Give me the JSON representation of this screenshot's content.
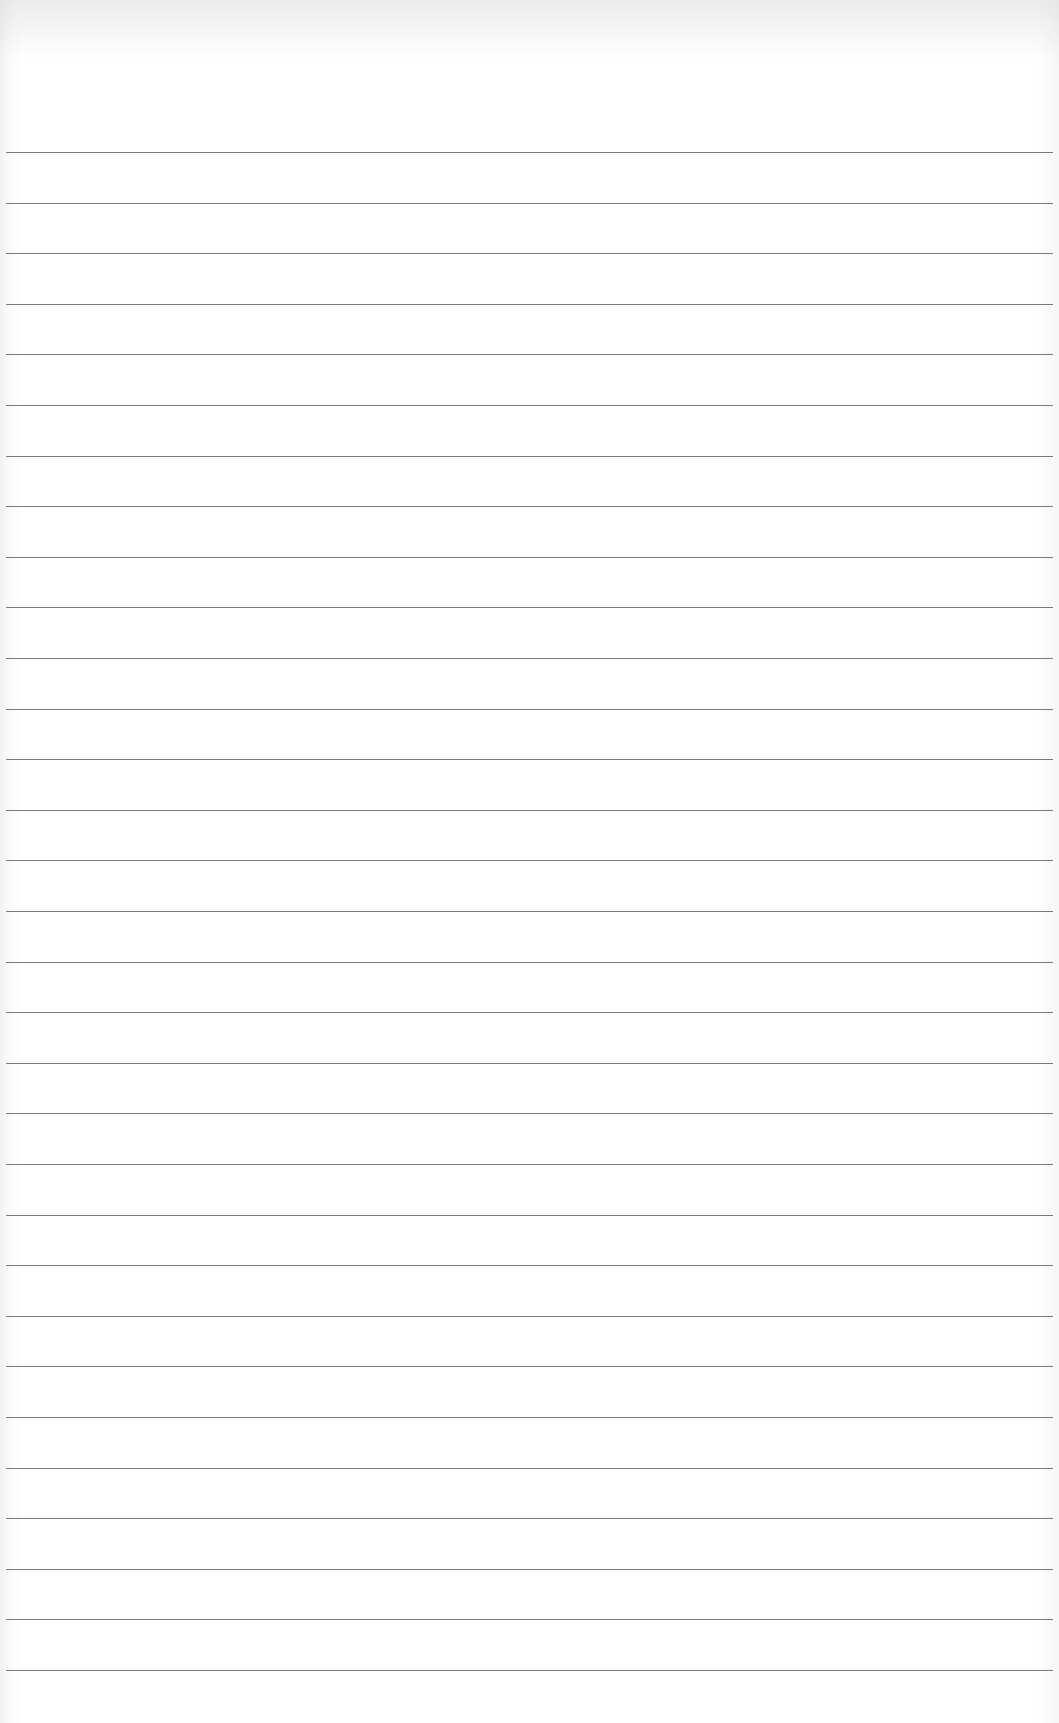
{
  "page": {
    "type": "blank lined paper",
    "background_color": "#ffffff",
    "rule_color": "#7a7a7a",
    "rule_count": 31,
    "first_rule_y": 152,
    "rule_spacing": 50.6,
    "text": ""
  }
}
